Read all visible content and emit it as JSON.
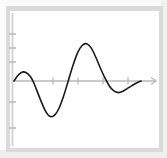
{
  "figure": {
    "kind": "function-graph",
    "caption": "",
    "background_color": "#ffffff",
    "frame_color": "#d9d9d9",
    "axis_color": "#b0b0b0",
    "curve_color": "#1a1a1a"
  },
  "chart_data": {
    "type": "line",
    "title": "",
    "xlabel": "",
    "ylabel": "",
    "grid": false,
    "legend": null,
    "legend_position": "none",
    "xlim": [
      0,
      7.6
    ],
    "ylim": [
      -2.6,
      2.6
    ],
    "x_axis": {
      "visible": true,
      "arrow_end": "right",
      "tick_values": [
        2,
        3.2,
        4.5
      ],
      "tick_labels": [
        "",
        "",
        ""
      ]
    },
    "y_axis": {
      "visible": true,
      "arrow_end": "none",
      "tick_values": [
        2,
        1.2,
        0.3,
        -1,
        -1.9
      ],
      "tick_labels": [
        "",
        "",
        "",
        "",
        ""
      ]
    },
    "series": [
      {
        "name": "curve",
        "color": "#1a1a1a",
        "line_width": 1.6,
        "x": [
          0.0,
          0.25,
          0.5,
          0.75,
          1.0,
          1.25,
          1.5,
          1.75,
          2.0,
          2.25,
          2.5,
          2.75,
          3.0,
          3.25,
          3.5,
          3.75,
          4.0,
          4.25,
          4.5,
          4.75,
          5.0,
          5.25,
          5.5,
          5.75,
          6.0,
          6.25,
          6.5,
          6.75,
          7.0
        ],
        "y": [
          0.0,
          0.38,
          0.55,
          0.45,
          0.1,
          -0.55,
          -1.25,
          -1.85,
          -2.15,
          -2.05,
          -1.6,
          -0.85,
          0.05,
          0.95,
          1.7,
          2.15,
          2.25,
          2.0,
          1.45,
          0.8,
          0.2,
          -0.3,
          -0.6,
          -0.7,
          -0.62,
          -0.45,
          -0.28,
          -0.12,
          0.0
        ]
      }
    ],
    "annotations": [],
    "key_points": {
      "first_peak": {
        "x": 0.5,
        "y": 0.55
      },
      "deep_trough": {
        "x": 2.05,
        "y": -2.18
      },
      "main_peak": {
        "x": 4.0,
        "y": 2.25
      },
      "final_trough": {
        "x": 5.8,
        "y": -0.7
      }
    }
  }
}
